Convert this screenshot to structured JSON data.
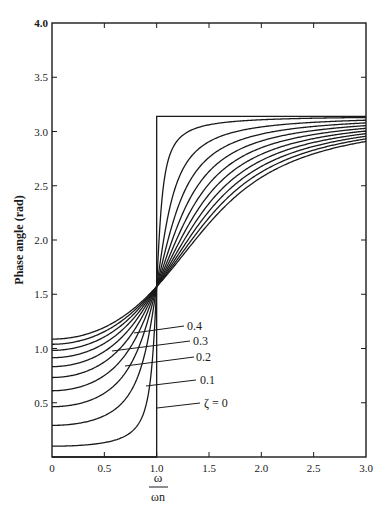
{
  "chart_data": {
    "type": "line",
    "title": "",
    "xlabel": "ω / ωn",
    "xlabel_numerator": "ω",
    "xlabel_denominator": "ωn",
    "ylabel": "Phase angle (rad)",
    "xlim": [
      0,
      3.0
    ],
    "ylim": [
      0,
      4.0
    ],
    "grid": false,
    "legend_position": "inline labels with leader lines",
    "x_ticks": [
      0,
      0.5,
      1.0,
      1.5,
      2.0,
      2.5,
      3.0
    ],
    "x_tick_labels": [
      "0",
      "0.5",
      "1.0",
      "1.5",
      "2.0",
      "2.5",
      "3.0"
    ],
    "y_ticks": [
      0.5,
      1.0,
      1.5,
      2.0,
      2.5,
      3.0,
      3.5,
      4.0
    ],
    "y_tick_labels": [
      "0.5",
      "1.0",
      "1.5",
      "2.0",
      "2.5",
      "3.0",
      "3.5",
      "4.0"
    ],
    "annotations": [
      {
        "text": "ζ = 0",
        "curve_index": 0
      },
      {
        "text": "0.1",
        "curve_index": 1
      },
      {
        "text": "0.2",
        "curve_index": 2
      },
      {
        "text": "0.3",
        "curve_index": 3
      },
      {
        "text": "0.4",
        "curve_index": 4
      }
    ],
    "step_curve": {
      "name": "ζ = 0",
      "x": [
        0,
        1.0,
        1.0,
        3.0
      ],
      "y": [
        0,
        0,
        3.14,
        3.14
      ]
    },
    "series": [
      {
        "name": "0.1",
        "x": [
          0,
          0.5,
          0.9,
          1.0,
          1.5,
          2.0,
          3.0
        ],
        "y": [
          0.2,
          0.26,
          0.81,
          1.57,
          3.06,
          3.08,
          3.12
        ]
      },
      {
        "name": "0.2",
        "x": [
          0,
          0.5,
          0.9,
          1.0,
          1.5,
          2.0,
          3.0
        ],
        "y": [
          0.54,
          0.68,
          1.26,
          1.57,
          2.9,
          3.04,
          3.1
        ]
      },
      {
        "name": "0.3",
        "x": [
          0,
          0.5,
          0.9,
          1.0,
          1.5,
          2.0,
          3.0
        ],
        "y": [
          0.79,
          0.93,
          1.39,
          1.57,
          2.76,
          2.97,
          3.08
        ]
      },
      {
        "name": "0.4",
        "x": [
          0,
          0.5,
          0.9,
          1.0,
          1.5,
          2.0,
          3.0
        ],
        "y": [
          0.95,
          1.08,
          1.44,
          1.57,
          2.63,
          2.9,
          3.05
        ]
      },
      {
        "name": "0.5",
        "x": [
          0,
          0.5,
          0.9,
          1.0,
          1.5,
          2.0,
          3.0
        ],
        "y": [
          1.06,
          1.17,
          1.47,
          1.57,
          2.53,
          2.84,
          3.03
        ]
      },
      {
        "name": "0.6",
        "x": [
          0,
          0.5,
          0.9,
          1.0,
          1.5,
          2.0,
          3.0
        ],
        "y": [
          1.14,
          1.24,
          1.49,
          1.57,
          2.45,
          2.78,
          3.01
        ]
      },
      {
        "name": "0.7",
        "x": [
          0,
          0.5,
          0.9,
          1.0,
          1.5,
          2.0,
          3.0
        ],
        "y": [
          1.2,
          1.29,
          1.5,
          1.57,
          2.39,
          2.73,
          2.98
        ]
      },
      {
        "name": "0.8",
        "x": [
          0,
          0.5,
          0.9,
          1.0,
          1.5,
          2.0,
          3.0
        ],
        "y": [
          1.25,
          1.32,
          1.51,
          1.57,
          2.33,
          2.69,
          2.96
        ]
      },
      {
        "name": "0.9",
        "x": [
          0,
          0.5,
          0.9,
          1.0,
          1.5,
          2.0,
          3.0
        ],
        "y": [
          1.28,
          1.35,
          1.52,
          1.57,
          2.29,
          2.65,
          2.94
        ]
      },
      {
        "name": "1.0",
        "x": [
          0,
          0.5,
          0.9,
          1.0,
          1.5,
          2.0,
          3.0
        ],
        "y": [
          1.31,
          1.37,
          1.52,
          1.57,
          2.25,
          2.62,
          2.91
        ]
      }
    ],
    "model_params": [
      0.1,
      0.3,
      0.5,
      0.7,
      0.9,
      1.1,
      1.3,
      1.5,
      1.7,
      1.9
    ]
  },
  "layout": {
    "plot_left": 52,
    "plot_right": 366,
    "plot_top": 23,
    "plot_bottom": 457,
    "label_lines": [
      {
        "x1": 157,
        "y1": 408,
        "x2": 200,
        "y2": 403,
        "tx": 204,
        "ty": 407
      },
      {
        "x1": 146,
        "y1": 386,
        "x2": 196,
        "y2": 380,
        "tx": 200,
        "ty": 384
      },
      {
        "x1": 125,
        "y1": 366,
        "x2": 194,
        "y2": 357,
        "tx": 196,
        "ty": 361
      },
      {
        "x1": 112,
        "y1": 351,
        "x2": 190,
        "y2": 341,
        "tx": 193,
        "ty": 345
      },
      {
        "x1": 134,
        "y1": 333,
        "x2": 184,
        "y2": 326,
        "tx": 187,
        "ty": 330
      }
    ]
  }
}
